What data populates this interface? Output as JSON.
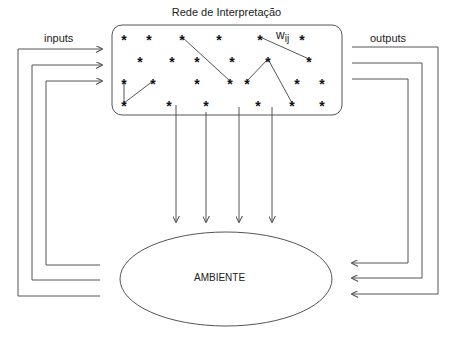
{
  "diagram": {
    "title": "Rede de Interpretação",
    "inputs_label": "inputs",
    "outputs_label": "outputs",
    "environment_label": "AMBIENTE",
    "weight_label_main": "w",
    "weight_label_sub": "ij",
    "star_glyph": "*",
    "stroke_color": "#555555",
    "stars": [
      [
        124,
        37
      ],
      [
        149,
        37
      ],
      [
        182,
        37
      ],
      [
        219,
        37
      ],
      [
        260,
        37
      ],
      [
        302,
        37
      ],
      [
        140,
        59
      ],
      [
        172,
        59
      ],
      [
        197,
        59
      ],
      [
        232,
        59
      ],
      [
        268,
        59
      ],
      [
        309,
        59
      ],
      [
        124,
        81
      ],
      [
        153,
        81
      ],
      [
        197,
        81
      ],
      [
        230,
        81
      ],
      [
        247,
        81
      ],
      [
        297,
        81
      ],
      [
        322,
        81
      ],
      [
        124,
        103
      ],
      [
        169,
        103
      ],
      [
        206,
        103
      ],
      [
        258,
        103
      ],
      [
        292,
        103
      ],
      [
        322,
        103
      ]
    ],
    "connections": [
      [
        182,
        37,
        230,
        81
      ],
      [
        260,
        37,
        309,
        59
      ],
      [
        268,
        59,
        247,
        81
      ],
      [
        268,
        59,
        292,
        103
      ],
      [
        124,
        81,
        124,
        103
      ],
      [
        153,
        81,
        124,
        103
      ]
    ]
  }
}
